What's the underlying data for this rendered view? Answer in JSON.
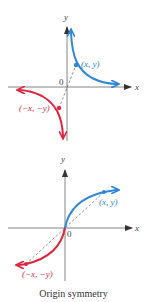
{
  "colors": {
    "positive_curve": "#2d86d8",
    "negative_curve": "#e0263e",
    "axis": "#555555",
    "dashed": "#666666"
  },
  "graphs": [
    {
      "name": "reciprocal-style graph",
      "x_axis_label": "x",
      "y_axis_label": "y",
      "origin_label": "0",
      "point_label": "(x, y)",
      "reflected_point_label": "(−x, −y)"
    },
    {
      "name": "cube-root-style graph",
      "x_axis_label": "x",
      "y_axis_label": "y",
      "origin_label": "0",
      "point_label": "(x, y)",
      "reflected_point_label": "(−x, −y)"
    }
  ],
  "caption": "Origin symmetry"
}
